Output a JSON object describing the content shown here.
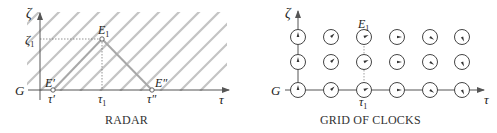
{
  "radar": {
    "caption": "RADAR",
    "axis_vertical_label": "ζ",
    "axis_horizontal_label": "τ",
    "worldline_label": "G",
    "zeta1_label": "ζ",
    "zeta1_sub": "1",
    "event_E1": "E",
    "event_E1_sub": "1",
    "event_Eprime": "E′",
    "event_Edoubleprime": "E″",
    "tau_prime": "τ′",
    "tau1": "τ",
    "tau1_sub": "1",
    "tau_doubleprime": "τ″"
  },
  "grid_of_clocks": {
    "caption": "GRID OF CLOCKS",
    "axis_vertical_label": "ζ",
    "axis_horizontal_label": "τ",
    "worldline_label": "G",
    "event_E1": "E",
    "event_E1_sub": "1",
    "tau1": "τ",
    "tau1_sub": "1",
    "columns": 6,
    "rows": 3,
    "clock_hand_angles_deg_by_column": [
      0,
      45,
      65,
      90,
      125,
      155
    ]
  }
}
